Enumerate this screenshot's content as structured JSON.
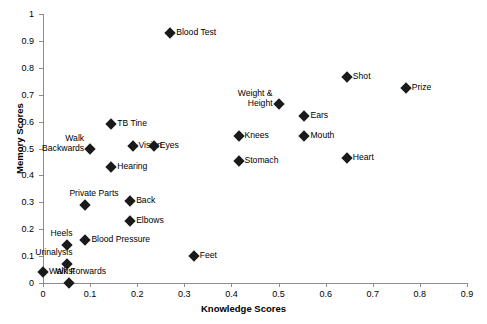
{
  "chart_data": {
    "type": "scatter",
    "title": "",
    "xlabel": "Knowledge Scores",
    "ylabel": "Memory Scores",
    "xlim": [
      0,
      0.9
    ],
    "ylim": [
      0,
      1
    ],
    "xticks": [
      "0",
      "0.1",
      "0.2",
      "0.3",
      "0.4",
      "0.5",
      "0.6",
      "0.7",
      "0.8",
      "0.9"
    ],
    "xtick_values": [
      0,
      0.1,
      0.2,
      0.3,
      0.4,
      0.5,
      0.6,
      0.7,
      0.8,
      0.9
    ],
    "yticks": [
      "0",
      "0.1",
      "0.2",
      "0.3",
      "0.4",
      "0.5",
      "0.6",
      "0.7",
      "0.8",
      "0.9",
      "1"
    ],
    "ytick_values": [
      0,
      0.1,
      0.2,
      0.3,
      0.4,
      0.5,
      0.6,
      0.7,
      0.8,
      0.9,
      1
    ],
    "grid": false,
    "legend": "none",
    "marker": "diamond",
    "marker_color": "#1a1a1a",
    "axis_color": "#8c8c8c",
    "points": [
      {
        "label": "Blood Test",
        "x": 0.27,
        "y": 0.93,
        "label_pos": "right"
      },
      {
        "label": "Shot",
        "x": 0.645,
        "y": 0.765,
        "label_pos": "right"
      },
      {
        "label": "Prize",
        "x": 0.77,
        "y": 0.725,
        "label_pos": "right"
      },
      {
        "label": "Weight & Height",
        "x": 0.5,
        "y": 0.665,
        "label_pos": "left-2line"
      },
      {
        "label": "Ears",
        "x": 0.555,
        "y": 0.62,
        "label_pos": "right"
      },
      {
        "label": "TB Tine",
        "x": 0.145,
        "y": 0.59,
        "label_pos": "right"
      },
      {
        "label": "Knees",
        "x": 0.415,
        "y": 0.545,
        "label_pos": "right"
      },
      {
        "label": "Mouth",
        "x": 0.555,
        "y": 0.545,
        "label_pos": "right"
      },
      {
        "label": "Vision",
        "x": 0.19,
        "y": 0.51,
        "label_pos": "right"
      },
      {
        "label": "Eyes",
        "x": 0.235,
        "y": 0.51,
        "label_pos": "right"
      },
      {
        "label": "Walk Backwards",
        "x": 0.1,
        "y": 0.5,
        "label_pos": "left-2line"
      },
      {
        "label": "Heart",
        "x": 0.645,
        "y": 0.465,
        "label_pos": "right"
      },
      {
        "label": "Stomach",
        "x": 0.415,
        "y": 0.455,
        "label_pos": "right"
      },
      {
        "label": "Hearing",
        "x": 0.145,
        "y": 0.43,
        "label_pos": "right"
      },
      {
        "label": "Back",
        "x": 0.185,
        "y": 0.305,
        "label_pos": "right"
      },
      {
        "label": "Private Parts",
        "x": 0.09,
        "y": 0.29,
        "label_pos": "above"
      },
      {
        "label": "Elbows",
        "x": 0.185,
        "y": 0.23,
        "label_pos": "right"
      },
      {
        "label": "Blood Pressure",
        "x": 0.09,
        "y": 0.16,
        "label_pos": "right"
      },
      {
        "label": "Heels",
        "x": 0.05,
        "y": 0.14,
        "label_pos": "above"
      },
      {
        "label": "Feet",
        "x": 0.32,
        "y": 0.1,
        "label_pos": "right"
      },
      {
        "label": "Urinalysis",
        "x": 0.05,
        "y": 0.07,
        "label_pos": "above-left"
      },
      {
        "label": "Walk Forwards",
        "x": 0.0,
        "y": 0.04,
        "label_pos": "right"
      },
      {
        "label": "Wrist",
        "x": 0.055,
        "y": 0.0,
        "label_pos": "above-left"
      }
    ]
  }
}
